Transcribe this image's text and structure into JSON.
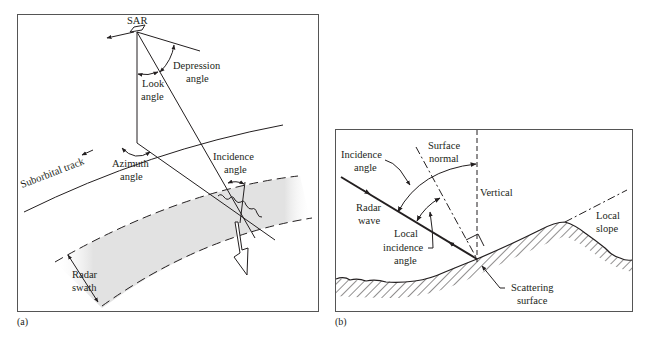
{
  "figure": {
    "panel_a": {
      "caption": "(a)",
      "labels": {
        "sar": "SAR",
        "depression_angle_1": "Depression",
        "depression_angle_2": "angle",
        "look_angle_1": "Look",
        "look_angle_2": "angle",
        "suborbital_track": "Suborbital track",
        "azimuth_angle_1": "Azimuth",
        "azimuth_angle_2": "angle",
        "incidence_angle_1": "Incidence",
        "incidence_angle_2": "angle",
        "radar_swath_1": "Radar",
        "radar_swath_2": "swath"
      }
    },
    "panel_b": {
      "caption": "(b)",
      "labels": {
        "incidence_angle_1": "Incidence",
        "incidence_angle_2": "angle",
        "surface_normal_1": "Surface",
        "surface_normal_2": "normal",
        "vertical": "Vertical",
        "radar_wave_1": "Radar",
        "radar_wave_2": "wave",
        "local_incidence_angle_1": "Local",
        "local_incidence_angle_2": "incidence",
        "local_incidence_angle_3": "angle",
        "local_slope_1": "Local",
        "local_slope_2": "slope",
        "scattering_surface_1": "Scattering",
        "scattering_surface_2": "surface"
      }
    },
    "colors": {
      "line": "#231f20",
      "swath_fill": "#e4e4e4",
      "frame": "#555555"
    }
  }
}
